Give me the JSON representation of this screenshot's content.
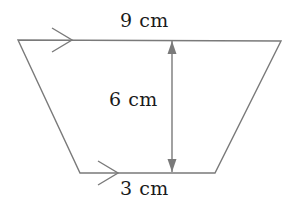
{
  "figure": {
    "type": "trapezoid-diagram",
    "background_color": "#ffffff",
    "stroke_color": "#7a7a7a",
    "text_color": "#1a1a1a",
    "stroke_width": 1.4,
    "shape": {
      "name": "trapezoid",
      "vertices": [
        {
          "name": "top-left",
          "x": 18,
          "y": 40
        },
        {
          "name": "top-right",
          "x": 281,
          "y": 41
        },
        {
          "name": "bottom-right",
          "x": 215,
          "y": 173
        },
        {
          "name": "bottom-left",
          "x": 80,
          "y": 173
        }
      ]
    },
    "labels": {
      "top_side": "9 cm",
      "height": "6 cm",
      "bottom_side": "3 cm"
    },
    "markers": [
      {
        "name": "parallel-marker-top",
        "kind": "chevron",
        "tip_x": 72,
        "center_y": 40,
        "half_height": 12
      },
      {
        "name": "parallel-marker-bottom",
        "kind": "chevron",
        "tip_x": 118,
        "center_y": 173,
        "half_height": 12
      }
    ],
    "height_arrow": {
      "name": "height-dimension-arrow",
      "x": 172,
      "y_top": 41,
      "y_bottom": 172,
      "arrowheads": "both"
    }
  }
}
